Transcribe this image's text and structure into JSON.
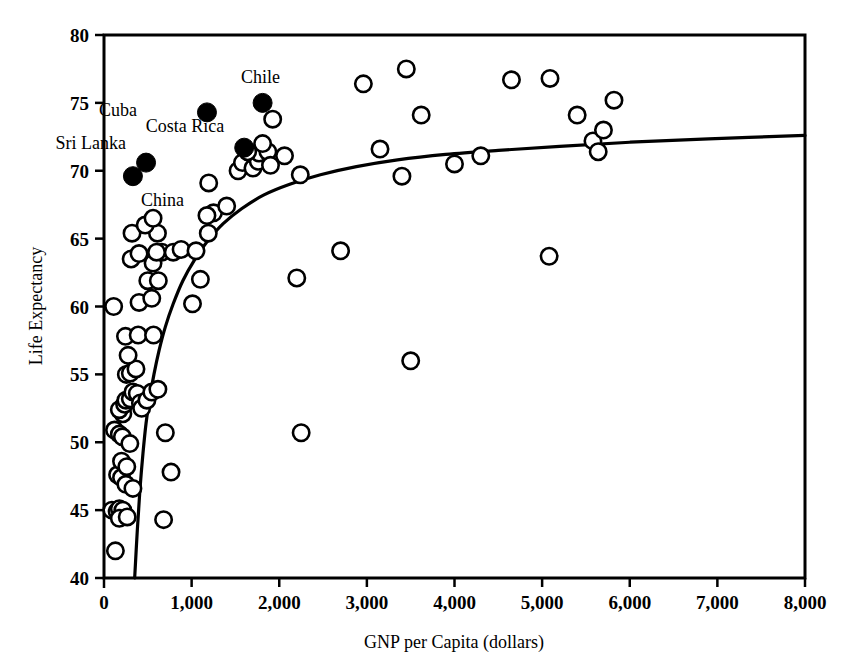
{
  "figure": {
    "background_color": "#ffffff",
    "ink_color": "#000000"
  },
  "chart_data": {
    "type": "scatter",
    "title": "",
    "subtitle": "",
    "xlabel": "GNP per Capita (dollars)",
    "ylabel": "Life Expectancy",
    "xlim": [
      0,
      8000
    ],
    "ylim": [
      40,
      80
    ],
    "xticks": [
      0,
      1000,
      2000,
      3000,
      4000,
      5000,
      6000,
      7000,
      8000
    ],
    "xticklabels": [
      "0",
      "1,000",
      "2,000",
      "3,000",
      "4,000",
      "5,000",
      "6,000",
      "7,000",
      "8,000"
    ],
    "yticks": [
      40,
      45,
      50,
      55,
      60,
      65,
      70,
      75,
      80
    ],
    "yticklabels": [
      "40",
      "45",
      "50",
      "55",
      "60",
      "65",
      "70",
      "75",
      "80"
    ],
    "grid": false,
    "legend": null,
    "marker_open": "white-filled circle with black outline",
    "marker_filled": "solid black circle",
    "series": [
      {
        "name": "Countries (unlabeled)",
        "marker": "open-circle",
        "points": [
          [
            90,
            45.0
          ],
          [
            150,
            44.9
          ],
          [
            130,
            42.0
          ],
          [
            175,
            45.1
          ],
          [
            215,
            45.0
          ],
          [
            175,
            44.4
          ],
          [
            265,
            44.5
          ],
          [
            155,
            47.6
          ],
          [
            200,
            47.4
          ],
          [
            250,
            46.9
          ],
          [
            330,
            46.6
          ],
          [
            120,
            50.9
          ],
          [
            175,
            50.6
          ],
          [
            210,
            50.4
          ],
          [
            295,
            49.9
          ],
          [
            200,
            48.6
          ],
          [
            260,
            48.2
          ],
          [
            215,
            52.1
          ],
          [
            175,
            52.4
          ],
          [
            235,
            52.8
          ],
          [
            250,
            53.1
          ],
          [
            300,
            53.2
          ],
          [
            330,
            53.7
          ],
          [
            380,
            53.6
          ],
          [
            415,
            52.9
          ],
          [
            430,
            52.5
          ],
          [
            490,
            53.1
          ],
          [
            545,
            53.7
          ],
          [
            615,
            53.9
          ],
          [
            255,
            55.0
          ],
          [
            300,
            55.1
          ],
          [
            365,
            55.4
          ],
          [
            275,
            56.4
          ],
          [
            245,
            57.8
          ],
          [
            390,
            57.9
          ],
          [
            565,
            57.9
          ],
          [
            110,
            60.0
          ],
          [
            400,
            60.3
          ],
          [
            545,
            60.6
          ],
          [
            500,
            61.9
          ],
          [
            620,
            61.9
          ],
          [
            560,
            63.2
          ],
          [
            310,
            63.5
          ],
          [
            400,
            63.9
          ],
          [
            660,
            64.0
          ],
          [
            790,
            64.0
          ],
          [
            610,
            65.4
          ],
          [
            320,
            65.4
          ],
          [
            470,
            66.0
          ],
          [
            560,
            66.5
          ],
          [
            600,
            64.0
          ],
          [
            880,
            64.2
          ],
          [
            1050,
            64.1
          ],
          [
            700,
            50.7
          ],
          [
            765,
            47.8
          ],
          [
            680,
            44.3
          ],
          [
            1010,
            60.2
          ],
          [
            1250,
            66.9
          ],
          [
            1190,
            65.4
          ],
          [
            1175,
            66.7
          ],
          [
            1100,
            62.0
          ],
          [
            1195,
            69.1
          ],
          [
            1400,
            67.4
          ],
          [
            1530,
            70.0
          ],
          [
            1580,
            70.6
          ],
          [
            1700,
            70.2
          ],
          [
            1760,
            70.7
          ],
          [
            1770,
            71.3
          ],
          [
            1640,
            71.4
          ],
          [
            1870,
            71.4
          ],
          [
            1810,
            72.0
          ],
          [
            1925,
            73.8
          ],
          [
            1900,
            70.4
          ],
          [
            2060,
            71.1
          ],
          [
            2240,
            69.7
          ],
          [
            2200,
            62.1
          ],
          [
            2700,
            64.1
          ],
          [
            2250,
            50.7
          ],
          [
            2960,
            76.4
          ],
          [
            3150,
            71.6
          ],
          [
            3450,
            77.5
          ],
          [
            3400,
            69.6
          ],
          [
            3620,
            74.1
          ],
          [
            3500,
            56.0
          ],
          [
            4000,
            70.5
          ],
          [
            4300,
            71.1
          ],
          [
            4650,
            76.7
          ],
          [
            5090,
            76.8
          ],
          [
            5080,
            63.7
          ],
          [
            5400,
            74.1
          ],
          [
            5580,
            72.2
          ],
          [
            5700,
            73.0
          ],
          [
            5820,
            75.2
          ],
          [
            5640,
            71.4
          ]
        ]
      },
      {
        "name": "Highlighted countries",
        "marker": "filled-circle",
        "points": [
          {
            "label": "China",
            "x": 330,
            "y": 69.6,
            "label_dx": 8,
            "label_dy": 30
          },
          {
            "label": "Sri Lanka",
            "x": 480,
            "y": 70.6,
            "label_dx": -20,
            "label_dy": -14
          },
          {
            "label": "Cuba",
            "x": 1175,
            "y": 74.3,
            "label_dx": -70,
            "label_dy": 4
          },
          {
            "label": "Costa Rica",
            "x": 1600,
            "y": 71.7,
            "label_dx": -20,
            "label_dy": -16
          },
          {
            "label": "Chile",
            "x": 1810,
            "y": 75.0,
            "label_dx": -2,
            "label_dy": -20
          }
        ]
      }
    ],
    "fit_curve": {
      "name": "logarithmic fit",
      "description": "Rising logarithmic trend line from (350, 40) flattening to (8000, 72.6)",
      "points": [
        [
          350,
          40.0
        ],
        [
          380,
          43.5
        ],
        [
          410,
          46.5
        ],
        [
          445,
          49.2
        ],
        [
          480,
          51.4
        ],
        [
          520,
          53.2
        ],
        [
          570,
          55.0
        ],
        [
          630,
          56.8
        ],
        [
          700,
          58.5
        ],
        [
          790,
          60.2
        ],
        [
          900,
          61.9
        ],
        [
          1030,
          63.4
        ],
        [
          1180,
          64.8
        ],
        [
          1360,
          66.1
        ],
        [
          1570,
          67.2
        ],
        [
          1820,
          68.2
        ],
        [
          2120,
          69.0
        ],
        [
          2470,
          69.7
        ],
        [
          2880,
          70.3
        ],
        [
          3350,
          70.8
        ],
        [
          3900,
          71.2
        ],
        [
          4500,
          71.5
        ],
        [
          5200,
          71.8
        ],
        [
          6000,
          72.1
        ],
        [
          6900,
          72.35
        ],
        [
          8000,
          72.6
        ]
      ]
    }
  },
  "annotations": {
    "labels": [
      "China",
      "Sri Lanka",
      "Cuba",
      "Costa Rica",
      "Chile"
    ]
  }
}
